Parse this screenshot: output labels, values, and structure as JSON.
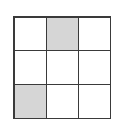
{
  "diagram": {
    "type": "grid",
    "rows": 3,
    "cols": 3,
    "colors": {
      "shaded": "#d6d6d6",
      "empty": "#ffffff",
      "line": "#3a3a3a"
    },
    "cells": [
      [
        0,
        1,
        0
      ],
      [
        0,
        0,
        0
      ],
      [
        1,
        0,
        0
      ]
    ]
  }
}
